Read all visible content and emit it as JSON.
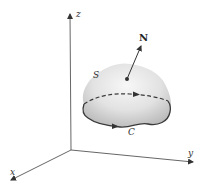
{
  "diagram": {
    "type": "surface-with-boundary-curve",
    "axes": {
      "x_label": "x",
      "y_label": "y",
      "z_label": "z"
    },
    "surface_label": "S",
    "curve_label": "C",
    "normal_label": "N",
    "colors": {
      "axis": "#444444",
      "surface_fill_light": "#f4f4f4",
      "surface_fill_dark": "#bdbdbd",
      "curve": "#3a3a3a",
      "text": "#222222"
    }
  }
}
